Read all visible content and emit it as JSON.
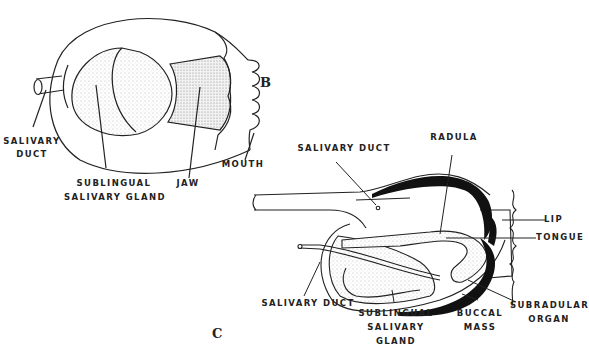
{
  "figure_b": {
    "letter": "B",
    "labels": {
      "salivary_duct_1": "SALIVARY",
      "salivary_duct_2": "DUCT",
      "sublingual_1": "SUBLINGUAL",
      "sublingual_2": "SALIVARY GLAND",
      "jaw": "JAW",
      "mouth": "MOUTH"
    }
  },
  "figure_c": {
    "letter": "C",
    "labels": {
      "salivary_duct_top": "SALIVARY DUCT",
      "radula": "RADULA",
      "lip": "LIP",
      "tongue": "TONGUE",
      "salivary_duct_bottom": "SALIVARY DUCT",
      "sublingual_1": "SUBLINGUAL",
      "sublingual_2": "SALIVARY",
      "sublingual_3": "GLAND",
      "buccal_1": "BUCCAL",
      "buccal_2": "MASS",
      "subradular_1": "SUBRADULAR",
      "subradular_2": "ORGAN"
    }
  }
}
